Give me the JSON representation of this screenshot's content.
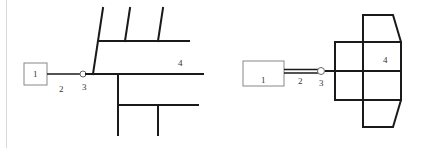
{
  "diagram_left": {
    "title": "Branch layout",
    "labels": {
      "component_1": "1",
      "component_2": "2",
      "component_3": "3",
      "component_4": "4"
    }
  },
  "diagram_right": {
    "title": "Grid layout",
    "labels": {
      "component_1": "1",
      "component_2": "2",
      "component_3": "3",
      "component_4": "4"
    }
  },
  "colors": {
    "line": "#1a1a1a",
    "box_border": "#888888",
    "text": "#333333",
    "edge": "#d8d8d8"
  }
}
